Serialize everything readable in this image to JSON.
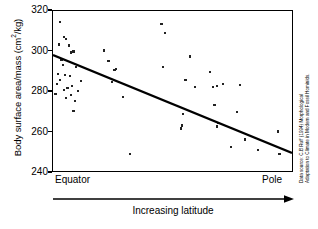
{
  "chart_data": {
    "type": "scatter",
    "title": "",
    "xlabel": "Increasing latitude",
    "ylabel": "Body surface area/mass (cm2/kg)",
    "ylabel_prefix": "Body surface area/mass (cm",
    "ylabel_exponent": "2",
    "ylabel_suffix": "/kg)",
    "ylim": [
      240,
      320
    ],
    "yticks": [
      320,
      300,
      280,
      260,
      240
    ],
    "ytick_labels": [
      "320",
      "300",
      "280",
      "260",
      "240"
    ],
    "xlim": [
      0,
      100
    ],
    "xtick_labels": [
      "Equator",
      "Pole"
    ],
    "x_start_label": "Equator",
    "x_end_label": "Pole",
    "grid": false,
    "legend": false,
    "series_name": "Human populations",
    "points": [
      [
        3.0,
        314.5
      ],
      [
        4.5,
        307.0
      ],
      [
        5.5,
        306.0
      ],
      [
        2.5,
        303.5
      ],
      [
        6.5,
        303.0
      ],
      [
        8.5,
        300.0
      ],
      [
        7.5,
        299.5
      ],
      [
        3.5,
        296.0
      ],
      [
        4.0,
        293.5
      ],
      [
        9.5,
        292.5
      ],
      [
        2.0,
        289.0
      ],
      [
        5.0,
        288.5
      ],
      [
        7.0,
        288.0
      ],
      [
        3.0,
        286.0
      ],
      [
        11.5,
        285.5
      ],
      [
        1.5,
        284.0
      ],
      [
        8.0,
        283.0
      ],
      [
        6.0,
        282.0
      ],
      [
        4.5,
        281.0
      ],
      [
        10.5,
        280.5
      ],
      [
        1.0,
        279.0
      ],
      [
        7.5,
        278.5
      ],
      [
        5.5,
        277.0
      ],
      [
        9.0,
        275.5
      ],
      [
        8.5,
        270.5
      ],
      [
        21.0,
        300.5
      ],
      [
        23.0,
        295.5
      ],
      [
        25.5,
        291.0
      ],
      [
        26.0,
        291.5
      ],
      [
        24.5,
        285.0
      ],
      [
        29.0,
        277.5
      ],
      [
        32.0,
        249.5
      ],
      [
        45.0,
        313.5
      ],
      [
        46.5,
        309.0
      ],
      [
        45.5,
        292.5
      ],
      [
        57.0,
        297.5
      ],
      [
        55.0,
        286.0
      ],
      [
        59.0,
        282.5
      ],
      [
        54.0,
        269.0
      ],
      [
        53.5,
        263.5
      ],
      [
        53.0,
        262.0
      ],
      [
        65.0,
        290.0
      ],
      [
        68.0,
        283.0
      ],
      [
        70.5,
        284.0
      ],
      [
        66.5,
        282.5
      ],
      [
        67.0,
        273.5
      ],
      [
        68.5,
        264.5
      ],
      [
        68.0,
        263.0
      ],
      [
        77.5,
        283.5
      ],
      [
        76.5,
        270.0
      ],
      [
        79.5,
        256.5
      ],
      [
        74.0,
        253.0
      ],
      [
        85.0,
        251.5
      ],
      [
        93.5,
        260.5
      ],
      [
        94.0,
        249.5
      ]
    ],
    "trendline": {
      "x_start": 0,
      "y_start": 298,
      "x_end": 100,
      "y_end": 249
    }
  },
  "source": {
    "line1": "Data source: C.B Ruff (1994) Morphological",
    "line2": "Adaptation to Climate in Modern and Fossil Hominids."
  }
}
